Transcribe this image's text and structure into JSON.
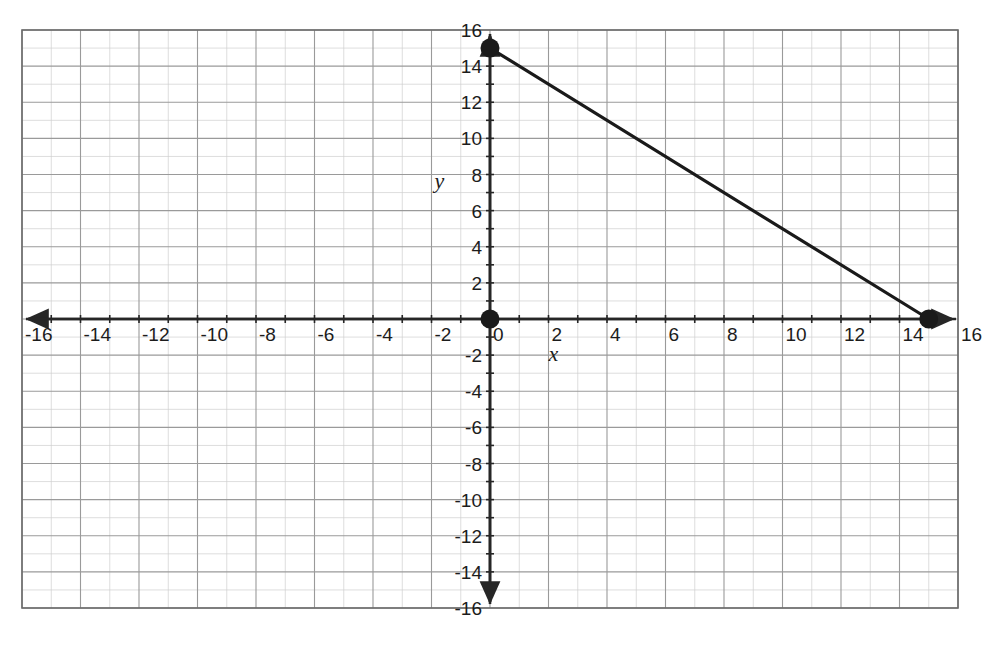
{
  "figure": {
    "title": "",
    "background_color": "#ffffff",
    "axis_color": "#262626",
    "grid_major_color": "#9a9a9a",
    "grid_minor_color": "#cfcfcf",
    "line_color": "#1a1a1a",
    "point_color": "#1a1a1a"
  },
  "axis_labels": {
    "x": "x",
    "y": "y"
  },
  "chart_data": {
    "type": "line",
    "title": "",
    "xlabel": "x",
    "ylabel": "y",
    "xlim": [
      -16,
      16
    ],
    "ylim": [
      -16,
      16
    ],
    "grid": true,
    "grid_major_step": 2,
    "grid_minor_step": 1,
    "legend": "none",
    "series": [
      {
        "name": "segment",
        "x": [
          0,
          15
        ],
        "y": [
          15,
          0
        ],
        "slope": -1,
        "intercept": 15,
        "equation": "y = -x + 15",
        "style": "solid",
        "endpoints_marked": true
      }
    ],
    "points": [
      {
        "label": "",
        "x": 0,
        "y": 15
      },
      {
        "label": "",
        "x": 0,
        "y": 0
      },
      {
        "label": "",
        "x": 15,
        "y": 0
      }
    ],
    "x_tick_labels": [
      "-16",
      "-14",
      "-12",
      "-10",
      "-8",
      "-6",
      "-4",
      "-2",
      "0",
      "2",
      "4",
      "6",
      "8",
      "10",
      "12",
      "14",
      "16"
    ],
    "x_tick_values": [
      -16,
      -14,
      -12,
      -10,
      -8,
      -6,
      -4,
      -2,
      0,
      2,
      4,
      6,
      8,
      10,
      12,
      14,
      16
    ],
    "y_tick_labels": [
      "16",
      "14",
      "12",
      "10",
      "8",
      "6",
      "4",
      "2",
      "-2",
      "-4",
      "-6",
      "-8",
      "-10",
      "-12",
      "-14",
      "-16"
    ],
    "y_tick_values": [
      16,
      14,
      12,
      10,
      8,
      6,
      4,
      2,
      -2,
      -4,
      -6,
      -8,
      -10,
      -12,
      -14,
      -16
    ]
  }
}
